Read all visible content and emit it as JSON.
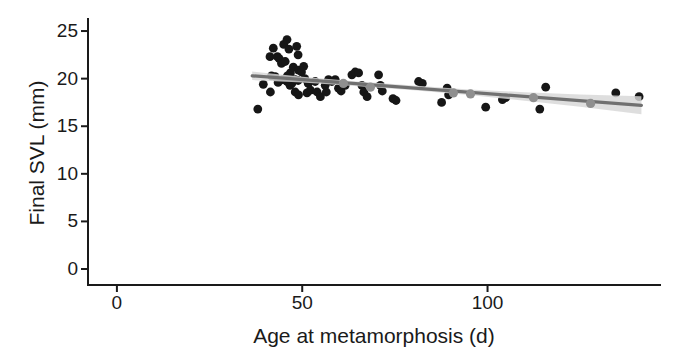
{
  "chart_data": {
    "type": "scatter",
    "title": "",
    "xlabel": "Age at metamorphosis (d)",
    "ylabel": "Final SVL (mm)",
    "xlim": [
      -7.8,
      146.8
    ],
    "ylim": [
      -1.68,
      26.37
    ],
    "xticks": [
      0,
      50,
      100
    ],
    "yticks": [
      0,
      5,
      10,
      15,
      20,
      25
    ],
    "grid": "off",
    "legend": "none",
    "colors": {
      "point": "#161616",
      "gray_point": "#8f8f8f",
      "regression_line": "#707070",
      "confidence_band": "#d7d7d7",
      "axis": "#1a1a1a",
      "background": "#ffffff"
    },
    "points": [
      [
        38.0,
        16.8
      ],
      [
        41.4,
        18.6
      ],
      [
        39.5,
        19.4
      ],
      [
        41.3,
        22.3
      ],
      [
        42.2,
        23.2
      ],
      [
        43.3,
        22.3
      ],
      [
        43.8,
        22.1
      ],
      [
        44.4,
        21.6
      ],
      [
        45.4,
        21.8
      ],
      [
        45.0,
        23.6
      ],
      [
        45.9,
        24.1
      ],
      [
        46.4,
        23.1
      ],
      [
        46.8,
        20.6
      ],
      [
        47.6,
        21.2
      ],
      [
        48.5,
        23.4
      ],
      [
        48.9,
        22.5
      ],
      [
        49.0,
        20.9
      ],
      [
        49.8,
        20.7
      ],
      [
        50.4,
        21.3
      ],
      [
        41.7,
        20.3
      ],
      [
        42.7,
        20.2
      ],
      [
        43.5,
        19.6
      ],
      [
        44.7,
        19.9
      ],
      [
        45.9,
        19.7
      ],
      [
        46.0,
        20.3
      ],
      [
        46.7,
        19.3
      ],
      [
        47.2,
        19.5
      ],
      [
        48.1,
        19.9
      ],
      [
        48.9,
        19.8
      ],
      [
        50.7,
        20.0
      ],
      [
        51.6,
        19.5
      ],
      [
        48.1,
        18.6
      ],
      [
        49.0,
        18.3
      ],
      [
        51.3,
        18.5
      ],
      [
        52.2,
        18.8
      ],
      [
        53.5,
        19.7
      ],
      [
        54.0,
        18.6
      ],
      [
        54.9,
        18.1
      ],
      [
        56.2,
        19.3
      ],
      [
        56.5,
        18.6
      ],
      [
        57.1,
        19.9
      ],
      [
        58.0,
        19.7
      ],
      [
        58.9,
        19.9
      ],
      [
        59.8,
        19.0
      ],
      [
        60.5,
        18.7
      ],
      [
        61.6,
        19.3
      ],
      [
        63.4,
        20.4
      ],
      [
        64.3,
        20.7
      ],
      [
        65.2,
        20.6
      ],
      [
        66.1,
        19.3
      ],
      [
        66.6,
        18.6
      ],
      [
        67.5,
        18.1
      ],
      [
        70.6,
        20.4
      ],
      [
        71.1,
        19.3
      ],
      [
        71.6,
        18.7
      ],
      [
        74.5,
        17.9
      ],
      [
        75.3,
        17.7
      ],
      [
        81.4,
        19.7
      ],
      [
        82.4,
        19.5
      ],
      [
        87.6,
        17.5
      ],
      [
        89.1,
        19.0
      ],
      [
        89.5,
        18.3
      ],
      [
        99.5,
        17.0
      ],
      [
        104.0,
        17.8
      ],
      [
        104.9,
        18.0
      ],
      [
        114.1,
        16.8
      ],
      [
        115.7,
        19.1
      ],
      [
        134.6,
        18.5
      ],
      [
        140.9,
        18.1
      ]
    ],
    "gray_points": [
      [
        61.1,
        19.5
      ],
      [
        68.4,
        19.1
      ],
      [
        90.8,
        18.5
      ],
      [
        95.4,
        18.4
      ],
      [
        112.4,
        18.0
      ],
      [
        127.8,
        17.4
      ]
    ],
    "regression": {
      "x": [
        36.5,
        141.5
      ],
      "y": [
        20.3,
        17.2
      ]
    },
    "confidence_band": {
      "x": [
        36.5,
        50,
        65,
        80,
        95,
        110,
        125,
        141.5
      ],
      "upper": [
        20.75,
        20.2,
        19.71,
        19.27,
        18.87,
        18.58,
        18.34,
        18.15
      ],
      "lower": [
        19.85,
        19.6,
        19.21,
        18.77,
        18.27,
        17.68,
        17.04,
        16.25
      ]
    }
  }
}
